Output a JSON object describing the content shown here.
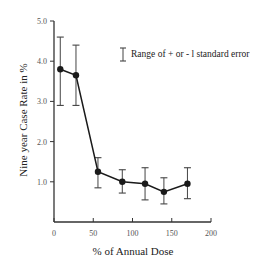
{
  "chart_data": {
    "type": "line",
    "title": "",
    "xlabel": "% of Annual Dose",
    "ylabel": "Nine year Case Rate in %",
    "xlim": [
      0,
      200
    ],
    "ylim": [
      0,
      5.0
    ],
    "x_ticks": [
      "0",
      "50",
      "100",
      "150",
      "200"
    ],
    "y_ticks": [
      "1.0",
      "2.0",
      "3.0",
      "4.0",
      "5.0"
    ],
    "grid": false,
    "legend": {
      "position": "upper right",
      "entries": [
        "Range of + or - l standard error"
      ]
    },
    "series": [
      {
        "name": "Nine year case rate",
        "x": [
          8,
          28,
          56,
          87,
          116,
          140,
          170
        ],
        "values": [
          3.8,
          3.65,
          1.25,
          1.0,
          0.95,
          0.75,
          0.95
        ],
        "error_upper": [
          4.6,
          4.4,
          1.6,
          1.3,
          1.35,
          1.1,
          1.35
        ],
        "error_lower": [
          2.9,
          2.9,
          0.85,
          0.72,
          0.55,
          0.45,
          0.58
        ]
      }
    ]
  },
  "colors": {
    "line": "#1a1a1a",
    "axis": "#333333",
    "error_bar": "#444444"
  }
}
